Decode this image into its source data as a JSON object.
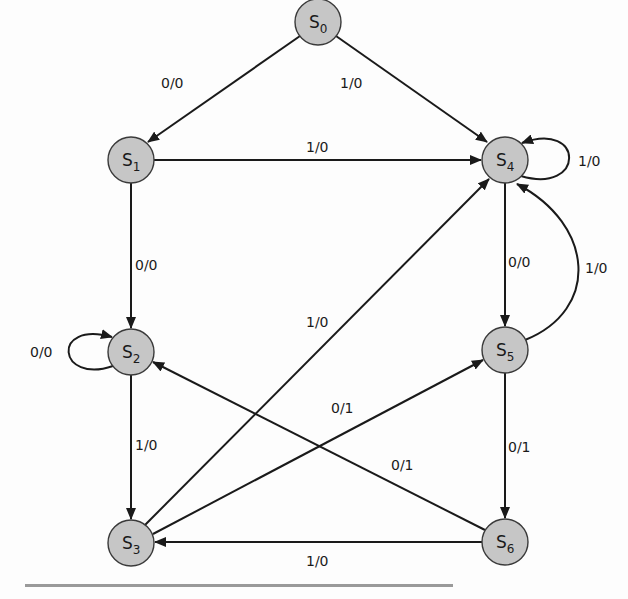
{
  "diagram": {
    "type": "finite-state-machine",
    "colors": {
      "node_fill": "#c6c6c6",
      "node_stroke": "#3a3a3a",
      "edge": "#1a1a1a",
      "background": "#fdfdfd"
    },
    "nodes": [
      {
        "id": "S0",
        "prefix": "S",
        "sub": "0",
        "x": 318,
        "y": 22
      },
      {
        "id": "S1",
        "prefix": "S",
        "sub": "1",
        "x": 131,
        "y": 160
      },
      {
        "id": "S2",
        "prefix": "S",
        "sub": "2",
        "x": 131,
        "y": 352
      },
      {
        "id": "S3",
        "prefix": "S",
        "sub": "3",
        "x": 131,
        "y": 543
      },
      {
        "id": "S4",
        "prefix": "S",
        "sub": "4",
        "x": 505,
        "y": 160
      },
      {
        "id": "S5",
        "prefix": "S",
        "sub": "5",
        "x": 505,
        "y": 350
      },
      {
        "id": "S6",
        "prefix": "S",
        "sub": "6",
        "x": 505,
        "y": 542
      }
    ],
    "edges": [
      {
        "from": "S0",
        "to": "S1",
        "label": "0/0"
      },
      {
        "from": "S0",
        "to": "S4",
        "label": "1/0"
      },
      {
        "from": "S1",
        "to": "S4",
        "label": "1/0"
      },
      {
        "from": "S1",
        "to": "S2",
        "label": "0/0"
      },
      {
        "from": "S2",
        "to": "S2",
        "label": "0/0"
      },
      {
        "from": "S2",
        "to": "S3",
        "label": "1/0"
      },
      {
        "from": "S3",
        "to": "S4",
        "label": "1/0"
      },
      {
        "from": "S3",
        "to": "S5",
        "label": "0/1"
      },
      {
        "from": "S6",
        "to": "S2",
        "label": "0/1"
      },
      {
        "from": "S4",
        "to": "S5",
        "label": "0/0"
      },
      {
        "from": "S5",
        "to": "S4",
        "label": "1/0"
      },
      {
        "from": "S4",
        "to": "S4",
        "label": "1/0"
      },
      {
        "from": "S5",
        "to": "S6",
        "label": "0/1"
      },
      {
        "from": "S6",
        "to": "S3",
        "label": "1/0"
      }
    ]
  }
}
